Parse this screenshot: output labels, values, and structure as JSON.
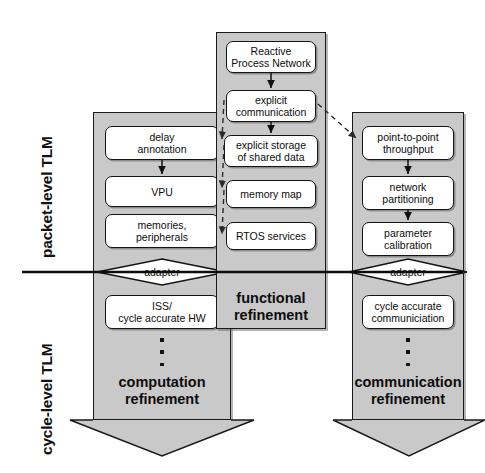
{
  "figure": {
    "background_color": "#ffffff",
    "column_fill": "#c9c9c9",
    "node_fill": "#ffffff",
    "stroke_color": "#141414"
  },
  "axis_labels": {
    "upper": "packet-level TLM",
    "lower": "cycle-level TLM"
  },
  "columns": [
    {
      "id": "computation",
      "caption_line1": "computation",
      "caption_line2": "refinement",
      "nodes": [
        {
          "id": "delay-annotation",
          "line1": "delay",
          "line2": "annotation"
        },
        {
          "id": "vpu",
          "line1": "VPU",
          "line2": ""
        },
        {
          "id": "memories-peripherals",
          "line1": "memories,",
          "line2": "peripherals"
        },
        {
          "id": "iss-cycle-accurate-hw",
          "line1": "ISS/",
          "line2": "cycle accurate HW"
        }
      ],
      "adapter_label": "adapter",
      "ellipsis_dots": 3
    },
    {
      "id": "functional",
      "caption_line1": "functional",
      "caption_line2": "refinement",
      "nodes": [
        {
          "id": "reactive-process-network",
          "line1": "Reactive",
          "line2": "Process Network"
        },
        {
          "id": "explicit-communication",
          "line1": "explicit",
          "line2": "communication"
        },
        {
          "id": "explicit-storage-shared-data",
          "line1": "explicit storage",
          "line2": "of shared data"
        },
        {
          "id": "memory-map",
          "line1": "memory map",
          "line2": ""
        },
        {
          "id": "rtos-services",
          "line1": "RTOS services",
          "line2": ""
        }
      ]
    },
    {
      "id": "communication",
      "caption_line1": "communication",
      "caption_line2": "refinement",
      "nodes": [
        {
          "id": "point-to-point-throughput",
          "line1": "point-to-point",
          "line2": "throughput"
        },
        {
          "id": "network-partitioning",
          "line1": "network",
          "line2": "partitioning"
        },
        {
          "id": "parameter-calibration",
          "line1": "parameter",
          "line2": "calibration"
        },
        {
          "id": "cycle-accurate-communiciation",
          "line1": "cycle accurate",
          "line2": "communiciation"
        }
      ],
      "adapter_label": "adapter",
      "ellipsis_dots": 3
    }
  ],
  "connections": {
    "solid_vertical_arrows": [
      {
        "from": "delay-annotation",
        "to": "vpu"
      },
      {
        "from": "reactive-process-network",
        "to": "explicit-communication"
      },
      {
        "from": "explicit-communication",
        "to": "explicit-storage-shared-data"
      },
      {
        "from": "point-to-point-throughput",
        "to": "network-partitioning"
      },
      {
        "from": "network-partitioning",
        "to": "parameter-calibration"
      }
    ],
    "dashed_arrows": [
      {
        "from": "explicit-communication",
        "to": "delay-annotation"
      },
      {
        "from": "explicit-storage-shared-data",
        "to": "vpu"
      },
      {
        "from": "memory-map",
        "to": "memories-peripherals"
      },
      {
        "from": "explicit-communication",
        "to": "point-to-point-throughput"
      }
    ],
    "abstraction_divider": {
      "label": "abstraction level divider",
      "orientation": "horizontal"
    }
  }
}
